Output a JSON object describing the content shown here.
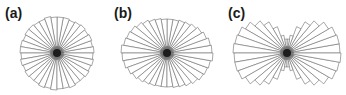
{
  "chart_data": [
    {
      "type": "rose",
      "label": "(a)",
      "bins_deg": 10,
      "center": [
        57,
        53
      ],
      "values": [
        37,
        36,
        37,
        36,
        37,
        36,
        35,
        36,
        36,
        36,
        37,
        36,
        36,
        37,
        37,
        36,
        37,
        37,
        36,
        37,
        36,
        37,
        36,
        36,
        37,
        36,
        37,
        36,
        36,
        37,
        36,
        36,
        37,
        36,
        37,
        36
      ],
      "description": "Nearly isotropic distribution"
    },
    {
      "type": "rose",
      "label": "(b)",
      "bins_deg": 10,
      "center": [
        167,
        53
      ],
      "values": [
        45,
        44,
        42,
        40,
        38,
        36,
        35,
        34,
        34,
        34,
        35,
        36,
        38,
        40,
        42,
        43,
        44,
        46,
        45,
        44,
        42,
        40,
        38,
        36,
        35,
        34,
        34,
        34,
        35,
        36,
        38,
        40,
        42,
        43,
        44,
        46
      ],
      "description": "Elliptical distribution elongated horizontally"
    },
    {
      "type": "rose",
      "label": "(c)",
      "bins_deg": 10,
      "center": [
        287,
        53
      ],
      "values": [
        53,
        53,
        52,
        48,
        42,
        36,
        28,
        18,
        14,
        14,
        18,
        28,
        36,
        42,
        48,
        52,
        53,
        54,
        53,
        53,
        52,
        48,
        42,
        36,
        28,
        18,
        14,
        14,
        18,
        28,
        36,
        42,
        48,
        52,
        53,
        54
      ],
      "description": "Bimodal bow-tie distribution concentrated horizontally"
    }
  ],
  "panels": [
    {
      "label": "(a)"
    },
    {
      "label": "(b)"
    },
    {
      "label": "(c)"
    }
  ],
  "colors": {
    "stroke": "#6b6b6b",
    "fill": "#ffffff",
    "label": "#1a1a1a"
  }
}
